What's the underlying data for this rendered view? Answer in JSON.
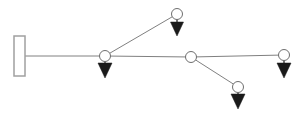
{
  "diagram": {
    "type": "structural-beam-free-body-diagram",
    "canvas": {
      "width": 303,
      "height": 120,
      "background": "#ffffff"
    },
    "colors": {
      "member_stroke": "#808080",
      "support_stroke": "#a0a0a0",
      "support_fill": "#ffffff",
      "node_stroke": "#6e6e6e",
      "node_fill": "#ffffff",
      "load_arrow_fill": "#1a1a1a",
      "load_arrow_stroke": "#1a1a1a"
    },
    "geometry": {
      "member_stroke_width": 1,
      "node_radius": 5.5,
      "node_stroke_width": 1,
      "support_stroke_width": 1.5
    },
    "support": {
      "name": "fixed-wall-support",
      "shape": "rectangle",
      "x": 14,
      "y": 36,
      "width": 11,
      "height": 40
    },
    "nodes": [
      {
        "id": "n1",
        "label": "node-left-joint",
        "x": 105,
        "y": 56,
        "has_load": true
      },
      {
        "id": "n2",
        "label": "node-top",
        "x": 177,
        "y": 14,
        "has_load": true
      },
      {
        "id": "n3",
        "label": "node-middle-joint",
        "x": 191,
        "y": 57,
        "has_load": false
      },
      {
        "id": "n4",
        "label": "node-lower-right",
        "x": 238,
        "y": 87,
        "has_load": true
      },
      {
        "id": "n5",
        "label": "node-right-end",
        "x": 284,
        "y": 55,
        "has_load": true
      }
    ],
    "members": [
      {
        "id": "m1",
        "label": "member-support-to-n1",
        "x1": 25,
        "y1": 56,
        "x2": 105,
        "y2": 56
      },
      {
        "id": "m2",
        "label": "member-n1-to-n3",
        "x1": 105,
        "y1": 56,
        "x2": 191,
        "y2": 57
      },
      {
        "id": "m3",
        "label": "member-n3-to-n5",
        "x1": 191,
        "y1": 57,
        "x2": 284,
        "y2": 55
      },
      {
        "id": "m4",
        "label": "member-n1-to-n2-diagonal",
        "x1": 105,
        "y1": 56,
        "x2": 177,
        "y2": 14
      },
      {
        "id": "m5",
        "label": "member-n3-to-n4-diagonal",
        "x1": 191,
        "y1": 57,
        "x2": 238,
        "y2": 87
      }
    ],
    "loads": [
      {
        "id": "p1",
        "label": "load-arrow-at-node-left-joint",
        "node": "n1",
        "x": 105,
        "direction": "down",
        "stem_top": 58,
        "stem_bottom": 63,
        "head_top": 63,
        "head_bottom": 78,
        "head_half_width": 7
      },
      {
        "id": "p2",
        "label": "load-arrow-at-node-top",
        "node": "n2",
        "x": 177,
        "direction": "down",
        "stem_top": 17,
        "stem_bottom": 22,
        "head_top": 22,
        "head_bottom": 36,
        "head_half_width": 6.5
      },
      {
        "id": "p3",
        "label": "load-arrow-at-node-lower-right",
        "node": "n4",
        "x": 238,
        "direction": "down",
        "stem_top": 89,
        "stem_bottom": 94,
        "head_top": 94,
        "head_bottom": 109,
        "head_half_width": 7
      },
      {
        "id": "p4",
        "label": "load-arrow-at-node-right-end",
        "node": "n5",
        "x": 284,
        "direction": "down",
        "stem_top": 58,
        "stem_bottom": 63,
        "head_top": 63,
        "head_bottom": 78,
        "head_half_width": 7
      }
    ]
  }
}
